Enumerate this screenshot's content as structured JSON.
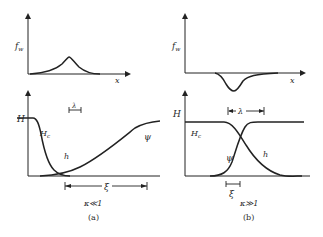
{
  "figure": {
    "panel_a": {
      "caption": "(a)",
      "condition": "κ≪1",
      "top_plot": {
        "ylabel": "f_w",
        "ylabel_main": "f",
        "ylabel_sub": "w",
        "xlabel": "x",
        "feature": "positive peak"
      },
      "bottom_plot": {
        "ylabel": "H",
        "curve_labels": {
          "Hc": "H",
          "Hc_sub": "c",
          "h": "h",
          "psi": "ψ"
        },
        "dimension_lambda": "λ",
        "dimension_xi": "ξ"
      }
    },
    "panel_b": {
      "caption": "(b)",
      "condition": "κ≫1",
      "top_plot": {
        "ylabel": "f_w",
        "ylabel_main": "f",
        "ylabel_sub": "w",
        "xlabel": "x",
        "feature": "negative dip"
      },
      "bottom_plot": {
        "ylabel": "H",
        "curve_labels": {
          "Hc": "H",
          "Hc_sub": "c",
          "h": "h",
          "psi": "ψ"
        },
        "dimension_lambda": "λ",
        "dimension_xi": "ξ"
      }
    }
  }
}
